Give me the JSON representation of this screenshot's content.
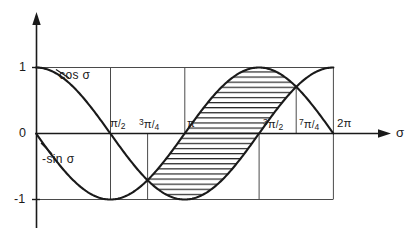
{
  "figure": {
    "background_color": "#ffffff",
    "ink_color": "#1a1a1a",
    "grid_color": "#555555",
    "variable_symbol": "σ"
  },
  "axes": {
    "x_axis_label": "σ",
    "y_ticks": [
      {
        "label": "1",
        "value": 1
      },
      {
        "label": "0",
        "value": 0
      },
      {
        "label": "-1",
        "value": -1
      }
    ],
    "x_ticks": [
      {
        "label_num": "π",
        "label_den": "2",
        "value_pi": 0.5,
        "full_label": "π/2"
      },
      {
        "label_sup": "3",
        "label_num": "π",
        "label_den": "4",
        "value_pi": 0.75,
        "full_label": "3π/4"
      },
      {
        "label_num": "π",
        "label_den": "",
        "value_pi": 1.0,
        "full_label": "π"
      },
      {
        "label_sup": "3",
        "label_num": "π",
        "label_den": "2",
        "value_pi": 1.5,
        "full_label": "3π/2"
      },
      {
        "label_sup": "7",
        "label_num": "π",
        "label_den": "4",
        "value_pi": 1.75,
        "full_label": "7π/4"
      },
      {
        "label_sup": "2",
        "label_num": "π",
        "label_den": "",
        "value_pi": 2.0,
        "full_label": "2π"
      }
    ]
  },
  "curve_labels": {
    "cosine": "cos σ",
    "negative_sine": "-sin σ"
  },
  "chart_data": {
    "type": "line",
    "title": "",
    "xlabel": "σ",
    "ylabel": "",
    "xlim": [
      0,
      6.283185307179586
    ],
    "ylim": [
      -1,
      1
    ],
    "x_unit": "pi",
    "grid": true,
    "legend": "inline-curve-labels",
    "series": [
      {
        "name": "cos σ",
        "label": "cos σ",
        "function": "cos(sigma)",
        "x_pi": [
          0,
          0.25,
          0.5,
          0.75,
          1.0,
          1.25,
          1.5,
          1.75,
          2.0
        ],
        "values": [
          1,
          0.7071,
          0,
          -0.7071,
          -1,
          -0.7071,
          0,
          0.7071,
          1
        ]
      },
      {
        "name": "-sin σ",
        "label": "-sin σ",
        "function": "-sin(sigma)",
        "x_pi": [
          0,
          0.25,
          0.5,
          0.75,
          1.0,
          1.25,
          1.5,
          1.75,
          2.0
        ],
        "values": [
          0,
          -0.7071,
          -1,
          -0.7071,
          0,
          0.7071,
          1,
          0.7071,
          0
        ]
      }
    ],
    "shaded_region": {
      "description": "Horizontally hatched area between the -sin σ curve (upper) and the cos σ curve (lower)",
      "hatch": "horizontal",
      "x_start_pi": 0.75,
      "x_end_pi": 1.75,
      "upper_curve": "-sin σ",
      "lower_curve": "cos σ"
    },
    "intersections": [
      {
        "x_pi": 0.75,
        "y": -0.7071
      },
      {
        "x_pi": 1.75,
        "y": 0.7071
      }
    ],
    "gridlines_vertical_pi": [
      0.5,
      1.0,
      1.5,
      2.0
    ],
    "gridlines_partial_pi": [
      0.75,
      1.75
    ],
    "gridlines_horizontal": [
      1,
      0,
      -1
    ]
  }
}
